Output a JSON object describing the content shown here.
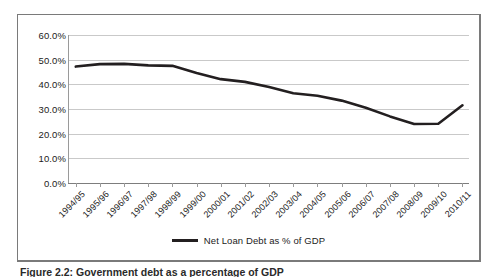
{
  "caption": "Figure 2.2: Government debt as a percentage of GDP",
  "legend": {
    "label": "Net Loan Debt as % of GDP",
    "color": "#231f20"
  },
  "chart_data": {
    "type": "line",
    "title": "",
    "xlabel": "",
    "ylabel": "",
    "ylim": [
      0,
      60
    ],
    "ytick_labels": [
      "0.0%",
      "10.0%",
      "20.0%",
      "30.0%",
      "40.0%",
      "50.0%",
      "60.0%"
    ],
    "ytick_values": [
      0,
      10,
      20,
      30,
      40,
      50,
      60
    ],
    "grid": true,
    "legend_position": "bottom",
    "categories": [
      "1994/95",
      "1995/96",
      "1996/97",
      "1997/98",
      "1998/99",
      "1999/00",
      "2000/01",
      "2001/02",
      "2002/03",
      "2003/04",
      "2004/05",
      "2005/06",
      "2006/07",
      "2007/08",
      "2008/09",
      "2009/10",
      "2010/11"
    ],
    "series": [
      {
        "name": "Net Loan Debt as % of GDP",
        "color": "#231f20",
        "values": [
          47.2,
          48.2,
          48.3,
          47.7,
          47.5,
          44.6,
          42.1,
          41.0,
          38.9,
          36.4,
          35.4,
          33.4,
          30.5,
          27.0,
          23.9,
          24.0,
          31.5
        ]
      }
    ]
  }
}
